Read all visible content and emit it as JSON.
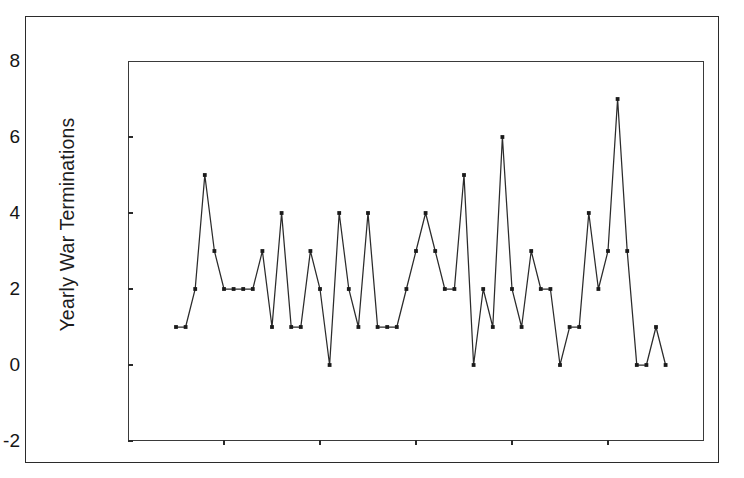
{
  "figure": {
    "kind": "line-chart",
    "background_color": "#ffffff",
    "line_color": "#2b2b2b",
    "marker_color": "#1a1a1a",
    "frame_color": "#2b2b2b"
  },
  "chart_data": {
    "type": "line",
    "title": "",
    "subtitle": "",
    "xlabel": "",
    "ylabel": "Yearly War Terminations",
    "xlim": [
      1940,
      2000
    ],
    "ylim": [
      -2,
      8
    ],
    "xticks": [
      1940,
      1950,
      1960,
      1970,
      1980,
      1990,
      2000
    ],
    "xtick_labels": [
      "1940",
      "1950",
      "1960",
      "1970",
      "1980",
      "1990",
      "2000"
    ],
    "yticks": [
      -2,
      0,
      2,
      4,
      6,
      8
    ],
    "ytick_labels": [
      "-2",
      "0",
      "2",
      "4",
      "6",
      "8"
    ],
    "grid": false,
    "legend": null,
    "legend_position": "none",
    "markers": "filled-square",
    "x": [
      1945,
      1946,
      1947,
      1948,
      1949,
      1950,
      1951,
      1952,
      1953,
      1954,
      1955,
      1956,
      1957,
      1958,
      1959,
      1960,
      1961,
      1962,
      1963,
      1964,
      1965,
      1966,
      1967,
      1968,
      1969,
      1970,
      1971,
      1972,
      1973,
      1974,
      1975,
      1976,
      1977,
      1978,
      1979,
      1980,
      1981,
      1982,
      1983,
      1984,
      1985,
      1986,
      1987,
      1988,
      1989,
      1990,
      1991,
      1992,
      1993,
      1994,
      1995,
      1996
    ],
    "values": [
      1,
      1,
      2,
      5,
      3,
      2,
      2,
      2,
      2,
      3,
      1,
      4,
      1,
      1,
      3,
      2,
      0,
      4,
      2,
      1,
      4,
      1,
      1,
      1,
      2,
      3,
      4,
      3,
      2,
      2,
      5,
      0,
      2,
      1,
      6,
      2,
      1,
      3,
      2,
      2,
      0,
      1,
      1,
      4,
      2,
      3,
      7,
      3,
      0,
      0,
      1,
      0
    ],
    "series": [
      {
        "name": "Yearly War Terminations",
        "values": [
          1,
          1,
          2,
          5,
          3,
          2,
          2,
          2,
          2,
          3,
          1,
          4,
          1,
          1,
          3,
          2,
          0,
          4,
          2,
          1,
          4,
          1,
          1,
          1,
          2,
          3,
          4,
          3,
          2,
          2,
          5,
          0,
          2,
          1,
          6,
          2,
          1,
          3,
          2,
          2,
          0,
          1,
          1,
          4,
          2,
          3,
          7,
          3,
          0,
          0,
          1,
          0
        ]
      }
    ]
  }
}
